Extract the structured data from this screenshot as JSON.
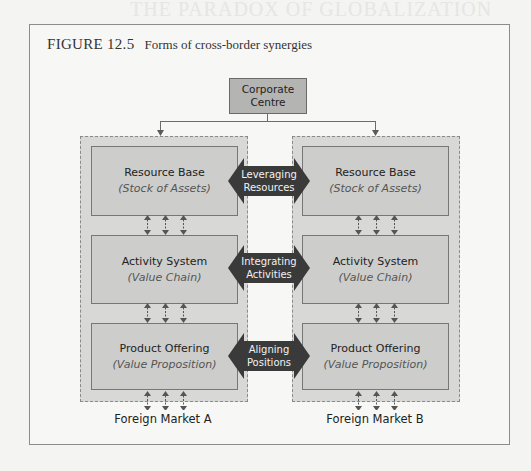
{
  "figure": {
    "number": "FIGURE 12.5",
    "caption": "Forms of cross-border synergies"
  },
  "background_text": {
    "heading_line1": "THE PARADOX OF GLOBALIZATION",
    "heading_line2": "LOCALIZATION"
  },
  "corporate_centre": {
    "line1": "Corporate",
    "line2": "Centre"
  },
  "columns": [
    {
      "market": "Foreign Market A",
      "boxes": [
        {
          "title": "Resource Base",
          "subtitle": "(Stock of Assets)"
        },
        {
          "title": "Activity System",
          "subtitle": "(Value Chain)"
        },
        {
          "title": "Product Offering",
          "subtitle": "(Value Proposition)"
        }
      ]
    },
    {
      "market": "Foreign Market B",
      "boxes": [
        {
          "title": "Resource Base",
          "subtitle": "(Stock of Assets)"
        },
        {
          "title": "Activity System",
          "subtitle": "(Value Chain)"
        },
        {
          "title": "Product Offering",
          "subtitle": "(Value Proposition)"
        }
      ]
    }
  ],
  "synergies": [
    {
      "line1": "Leveraging",
      "line2": "Resources"
    },
    {
      "line1": "Integrating",
      "line2": "Activities"
    },
    {
      "line1": "Aligning",
      "line2": "Positions"
    }
  ],
  "colors": {
    "box_fill": "#cdcdcb",
    "container_fill": "#d8d8d6",
    "corporate_fill": "#b4b4b2",
    "synergy_arrow": "#3a3a3a"
  }
}
